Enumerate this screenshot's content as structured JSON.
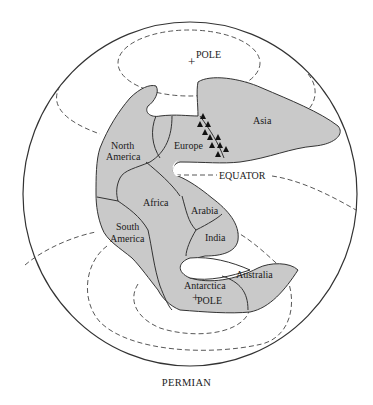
{
  "figure": {
    "caption": "PERMIAN",
    "colors": {
      "land_fill": "#c9c9c9",
      "line": "#333333",
      "background": "#ffffff"
    }
  },
  "labels": {
    "north_pole": "POLE",
    "south_pole": "POLE",
    "equator": "EQUATOR",
    "continents": {
      "asia": "Asia",
      "north_america_1": "North",
      "north_america_2": "America",
      "europe": "Europe",
      "africa": "Africa",
      "arabia": "Arabia",
      "india": "India",
      "south_america_1": "South",
      "south_america_2": "America",
      "australia": "Australia",
      "antarctica": "Antarctica"
    }
  },
  "symbols": {
    "pole_marker": "+",
    "mountain_belt": "triangle markers along Europe–Asia suture"
  }
}
